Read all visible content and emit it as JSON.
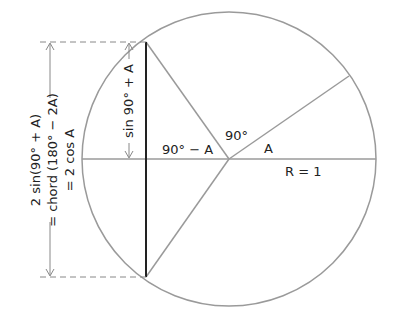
{
  "diagram": {
    "labels": {
      "left_line1": "2 sin(90° + A)",
      "left_line2": "= chord (180° − 2A)",
      "left_line3": "= 2 cos A",
      "sin_label": "sin 90° + A",
      "angle_90_minus_A": "90° − A",
      "angle_90": "90°",
      "angle_A": "A",
      "radius": "R = 1"
    },
    "colors": {
      "circle": "#9a9a9a",
      "chord": "#222222",
      "dash": "#888888",
      "text": "#222222"
    }
  }
}
